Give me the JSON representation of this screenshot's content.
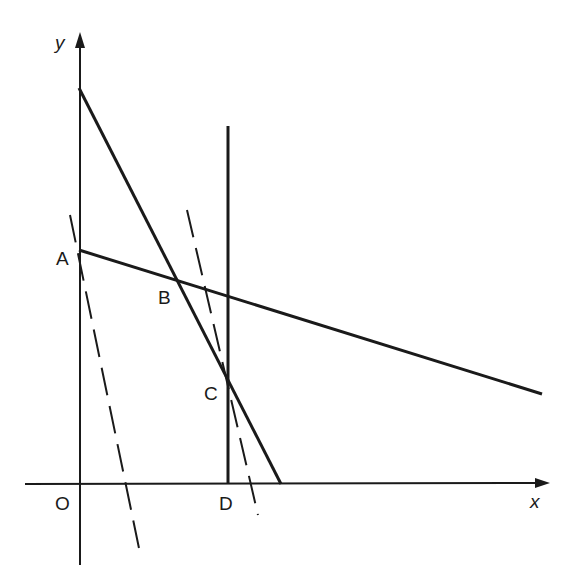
{
  "diagram": {
    "type": "linear-programming-graph",
    "axes": {
      "x_label": "x",
      "y_label": "y",
      "origin_label": "O"
    },
    "points": [
      {
        "label": "A",
        "x": 79,
        "y": 250
      },
      {
        "label": "B",
        "x": 175,
        "y": 280
      },
      {
        "label": "C",
        "x": 228,
        "y": 379
      },
      {
        "label": "D",
        "x": 228,
        "y": 484
      }
    ],
    "solid_lines": [
      {
        "name": "steep-constraint-line",
        "x1": 79,
        "y1": 88,
        "x2": 281,
        "y2": 484
      },
      {
        "name": "shallow-constraint-line",
        "x1": 79,
        "y1": 250,
        "x2": 542,
        "y2": 394
      },
      {
        "name": "vertical-constraint-line",
        "x1": 228,
        "y1": 126,
        "x2": 228,
        "y2": 484
      }
    ],
    "dashed_lines": [
      {
        "name": "objective-line-through-a",
        "x1": 70,
        "y1": 215,
        "x2": 140,
        "y2": 553
      },
      {
        "name": "objective-line-through-c",
        "x1": 187,
        "y1": 210,
        "x2": 258,
        "y2": 515
      }
    ],
    "colors": {
      "stroke": "#1a1a1a",
      "background": "#ffffff"
    }
  }
}
